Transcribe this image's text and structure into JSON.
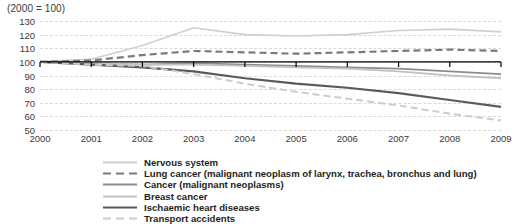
{
  "chart_data": {
    "type": "line",
    "title": "(2000 = 100)",
    "xlabel": "",
    "ylabel": "",
    "x": [
      2000,
      2001,
      2002,
      2003,
      2004,
      2005,
      2006,
      2007,
      2008,
      2009
    ],
    "tick_labels_x": [
      "2000",
      "2001",
      "2002",
      "2003",
      "2004",
      "2005",
      "2006",
      "2007",
      "2008",
      "2009"
    ],
    "tick_labels_y": [
      "130",
      "120",
      "110",
      "100",
      "90",
      "80",
      "70",
      "60",
      "50"
    ],
    "ylim": [
      50,
      130
    ],
    "xlim": [
      2000,
      2009
    ],
    "grid": true,
    "grid_style": "dashed-horizontal",
    "baseline": 100,
    "legend_position": "bottom-left",
    "series": [
      {
        "name": "Nervous system",
        "color": "#cfcfcf",
        "style": "solid",
        "width": 1.6,
        "values": [
          100,
          102,
          112,
          125,
          120,
          119,
          120,
          123,
          124,
          122
        ]
      },
      {
        "name": "Lung cancer (malignant neoplasm of larynx, trachea, bronchus and lung)",
        "color": "#7a7a7a",
        "style": "dashed",
        "width": 2.2,
        "values": [
          100,
          101,
          105,
          108,
          107,
          106,
          107,
          108,
          109,
          108
        ]
      },
      {
        "name": "Cancer (malignant neoplasms)",
        "color": "#8c8c8c",
        "style": "solid",
        "width": 1.8,
        "values": [
          100,
          99,
          98,
          99,
          98,
          97,
          96,
          95,
          93,
          91
        ]
      },
      {
        "name": "Breast cancer",
        "color": "#c2c2c2",
        "style": "solid",
        "width": 1.8,
        "values": [
          100,
          99,
          98,
          98,
          97,
          96,
          95,
          93,
          90,
          88
        ]
      },
      {
        "name": "Ischaemic heart diseases",
        "color": "#5a5a5a",
        "style": "solid",
        "width": 2.2,
        "values": [
          100,
          98,
          96,
          93,
          88,
          84,
          81,
          77,
          72,
          67
        ]
      },
      {
        "name": "Transport accidents",
        "color": "#cccccc",
        "style": "dashed",
        "width": 2.0,
        "values": [
          100,
          98,
          97,
          91,
          84,
          78,
          73,
          68,
          62,
          57
        ]
      }
    ]
  }
}
